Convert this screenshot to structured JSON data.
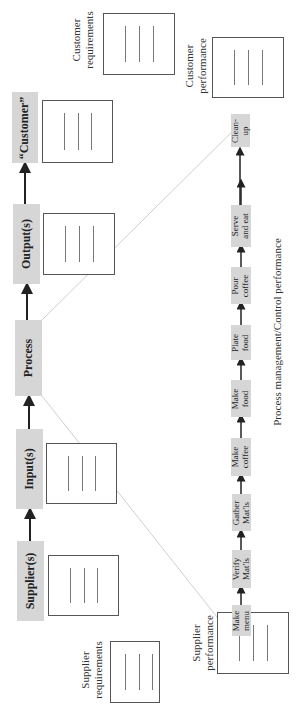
{
  "diagram": {
    "orientation": "rotated-90-ccw",
    "main_flow": [
      {
        "id": "supplier",
        "label": "Supplier(s)"
      },
      {
        "id": "input",
        "label": "Input(s)"
      },
      {
        "id": "process",
        "label": "Process"
      },
      {
        "id": "output",
        "label": "Output(s)"
      },
      {
        "id": "customer",
        "label": "“Customer”"
      }
    ],
    "process_steps": [
      {
        "id": "make-menu",
        "label": "Make\nmenu"
      },
      {
        "id": "verify-matls",
        "label": "Verify\nMat'ls"
      },
      {
        "id": "gather-matls",
        "label": "Gather\nMat'ls"
      },
      {
        "id": "make-coffee",
        "label": "Make\ncoffee"
      },
      {
        "id": "make-food",
        "label": "Make\nfood"
      },
      {
        "id": "plate-food",
        "label": "Plate\nfood"
      },
      {
        "id": "pour-coffee",
        "label": "Pour\ncoffee"
      },
      {
        "id": "serve-and-eat",
        "label": "Serve\nand eat"
      },
      {
        "id": "clean-up",
        "label": "Clean-\nup"
      }
    ],
    "side_labels": {
      "customer_requirements": "Customer\nrequirements",
      "customer_performance": "Customer\nperformance",
      "supplier_requirements": "Supplier\nrequirements",
      "supplier_performance": "Supplier\nperformance",
      "process_management": "Process management/Control performance"
    },
    "colors": {
      "box_fill": "#d6d6d6",
      "arrow": "#222222",
      "zoom_lines": "#cfcfcf",
      "doc_border": "#555555"
    }
  }
}
